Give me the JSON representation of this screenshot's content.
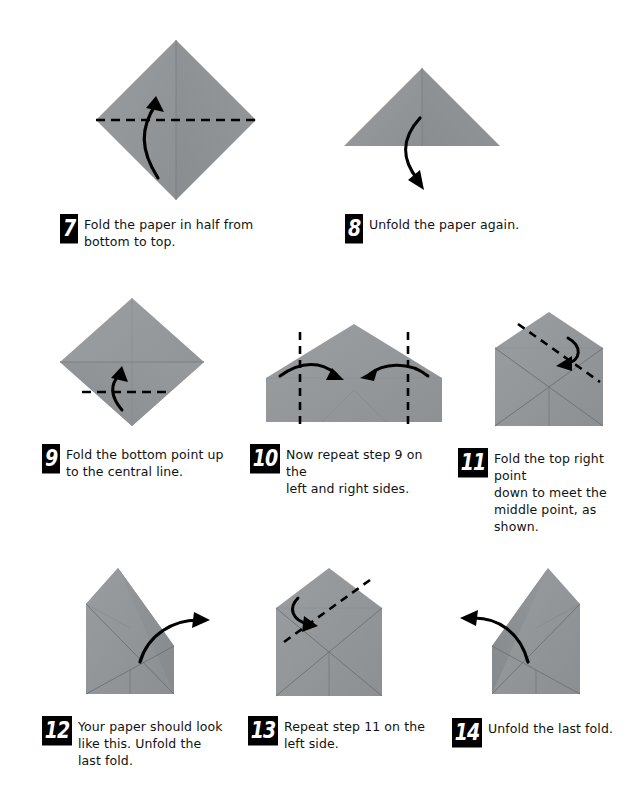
{
  "document": {
    "type": "origami-instructions",
    "page_background": "#ffffff",
    "paper_color": "#939699",
    "paper_shadow_color": "#7e8285",
    "crease_color": "#6f7377",
    "fold_line_color": "#000000",
    "arrow_color": "#000000",
    "badge_background": "#000000",
    "badge_text_color": "#ffffff"
  },
  "steps": [
    {
      "number": "7",
      "text": "Fold the paper in half from\nbottom to top.",
      "figure": "diamond-with-horizontal-fold-line-and-up-arrow"
    },
    {
      "number": "8",
      "text": "Unfold the paper again.",
      "figure": "triangle-with-down-unfold-arrow"
    },
    {
      "number": "9",
      "text": "Fold the bottom point up\nto the central line.",
      "figure": "diamond-with-lower-fold-line-and-up-arrow"
    },
    {
      "number": "10",
      "text": "Now repeat step 9 on the\nleft and right sides.",
      "figure": "pentagon-with-two-vertical-fold-lines-and-inward-arrows"
    },
    {
      "number": "11",
      "text": "Fold the top right point\ndown to meet the\nmiddle point, as shown.",
      "figure": "envelope-with-top-right-diagonal-fold-line-and-arrow"
    },
    {
      "number": "12",
      "text": "Your paper should look\nlike this. Unfold the\nlast fold.",
      "figure": "envelope-top-right-folded-with-up-right-unfold-arrow"
    },
    {
      "number": "13",
      "text": "Repeat step 11 on the\nleft side.",
      "figure": "envelope-with-top-left-diagonal-fold-line-and-arrow"
    },
    {
      "number": "14",
      "text": "Unfold the last fold.",
      "figure": "envelope-top-left-folded-with-up-left-unfold-arrow"
    }
  ]
}
